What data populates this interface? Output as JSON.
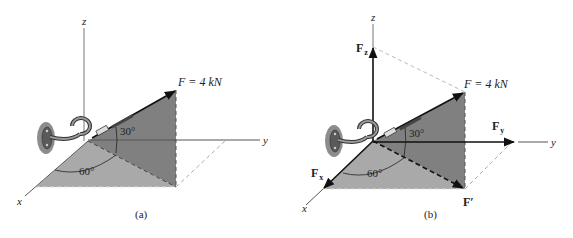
{
  "figure": {
    "panels": [
      {
        "id": "a",
        "caption": "(a)",
        "axes": {
          "x": "x",
          "y": "y",
          "z": "z"
        },
        "force_label": "F = 4 kN",
        "angles": {
          "elevation": "30°",
          "azimuth": "60°"
        }
      },
      {
        "id": "b",
        "caption": "(b)",
        "axes": {
          "x": "x",
          "y": "y",
          "z": "z"
        },
        "force_label": "F = 4 kN",
        "angles": {
          "elevation": "30°",
          "azimuth": "60°"
        },
        "components": {
          "Fx": "F",
          "Fx_sub": "x",
          "Fy": "F",
          "Fy_sub": "y",
          "Fz": "F",
          "Fz_sub": "z",
          "Fprime": "F′"
        }
      }
    ],
    "colors": {
      "dark_plane": "#808080",
      "light_plane": "#a9a9a9",
      "axis": "#555555",
      "arrow": "#111111"
    }
  }
}
